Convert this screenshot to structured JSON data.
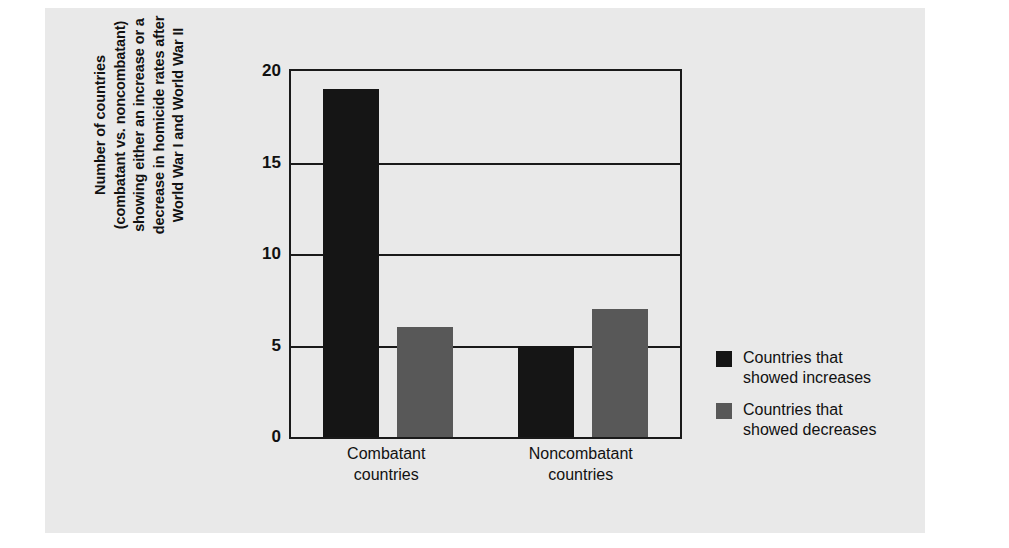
{
  "chart_data": {
    "type": "bar",
    "title": "",
    "categories": [
      "Combatant countries",
      "Noncombatant countries"
    ],
    "category_lines": [
      [
        "Combatant",
        "countries"
      ],
      [
        "Noncombatant",
        "countries"
      ]
    ],
    "series": [
      {
        "name": "Countries that showed increases",
        "values": [
          19,
          5
        ],
        "color": "#151515"
      },
      {
        "name": "Countries that showed decreases",
        "values": [
          6,
          7
        ],
        "color": "#585858"
      }
    ],
    "legend_lines": [
      [
        "Countries that",
        "showed increases"
      ],
      [
        "Countries that",
        "showed decreases"
      ]
    ],
    "xlabel": "",
    "ylabel": "Number of countries (combatant vs. noncombatant) showing either an increase or a decrease in homicide rates after World War I and World War II",
    "ylabel_lines": [
      "Number of countries",
      "(combatant vs. noncombatant)",
      "showing either an increase or a",
      "decrease in homicide rates after",
      "World War I and World War II"
    ],
    "ylim": [
      0,
      20
    ],
    "yticks": [
      0,
      5,
      10,
      15,
      20
    ],
    "ytick_labels": [
      "0",
      "5",
      "10",
      "15",
      "20"
    ],
    "grid": true,
    "legend_position": "right"
  },
  "colors": {
    "panel_background": "#e9e9e9",
    "page_background": "#ffffff",
    "axis": "#1a1a1a",
    "increase": "#151515",
    "decrease": "#585858",
    "text": "#111111"
  }
}
